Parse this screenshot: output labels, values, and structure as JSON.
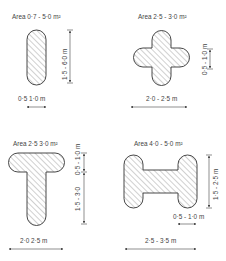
{
  "panels": [
    {
      "id": "stadium",
      "area_label": "Area 0·7 - 5·0 m²",
      "dims": [
        {
          "label": "1·5 - 6·0 m",
          "orientation": "vertical"
        },
        {
          "label": "0·5  1·0 m",
          "orientation": "horizontal"
        }
      ]
    },
    {
      "id": "cross",
      "area_label": "Area  2·5 - 3·0 m²",
      "dims": [
        {
          "label": "0·5 - 1·0 m",
          "orientation": "vertical"
        },
        {
          "label": "2·0 - 2·5 m",
          "orientation": "horizontal"
        }
      ]
    },
    {
      "id": "tee",
      "area_label": "Area 2·5  3·0 m²",
      "dims": [
        {
          "label": "0·5 - 1·0 m",
          "orientation": "vertical"
        },
        {
          "label": "1·5 - 3·0",
          "orientation": "vertical"
        },
        {
          "label": "2·0  2·5 m",
          "orientation": "horizontal"
        }
      ]
    },
    {
      "id": "h-shape",
      "area_label": "Area 4·0 - 5·0 m²",
      "dims": [
        {
          "label": "1·5 - 2·5 m",
          "orientation": "vertical"
        },
        {
          "label": "0·5 - 1·0 m",
          "orientation": "horizontal"
        },
        {
          "label": "2·5 - 3·5 m",
          "orientation": "horizontal"
        }
      ]
    }
  ]
}
